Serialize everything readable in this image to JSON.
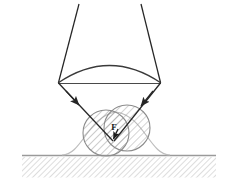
{
  "figure": {
    "background_color": "#ffffff",
    "width": 238,
    "height": 188,
    "labels": [
      {
        "id": "force-label",
        "text": "F",
        "x": 116,
        "y": 129,
        "meaning": "force vector label"
      }
    ],
    "colors": {
      "ray_stroke": "#262626",
      "lens_stroke": "#3a3a3a",
      "circle_stroke": "#8c8c8c",
      "bump_stroke": "#b0b0b0",
      "hatch_particle": "#8c8c8c",
      "hatch_ground": "#b8b8b8",
      "ground_line": "#8f8f8f",
      "label_fill": "#1a1a1a"
    },
    "lens": {
      "name": "converging-lens",
      "left_vertex": [
        58,
        83
      ],
      "right_vertex": [
        161,
        83
      ],
      "arc_apex_y": 62,
      "chord_y": 83
    },
    "rays": [
      {
        "name": "incoming-ray-left",
        "from": [
          79,
          4
        ],
        "to": [
          58,
          83
        ],
        "arrow": false
      },
      {
        "name": "incoming-ray-right",
        "from": [
          141,
          4
        ],
        "to": [
          161,
          83
        ],
        "arrow": false
      },
      {
        "name": "focused-ray-left",
        "from": [
          58,
          83
        ],
        "to": [
          112,
          140
        ],
        "arrow": true,
        "arrow_at": [
          74,
          100
        ]
      },
      {
        "name": "focused-ray-right",
        "from": [
          161,
          83
        ],
        "to": [
          112,
          140
        ],
        "arrow": true,
        "arrow_at": [
          145,
          100
        ]
      }
    ],
    "particle_circles": [
      {
        "name": "particle-circle-left",
        "cx": 106,
        "cy": 133,
        "r": 23
      },
      {
        "name": "particle-circle-right",
        "cx": 127,
        "cy": 128,
        "r": 23
      }
    ],
    "surface_bump": {
      "name": "substrate-bump",
      "baseline_y": 155,
      "peak_x": 116,
      "peak_y": 112,
      "left_foot_x": 68,
      "right_foot_x": 164
    },
    "ground": {
      "name": "substrate-ground",
      "line_y": 155,
      "hatch_top": 157,
      "hatch_bottom": 178,
      "left_x": 22,
      "right_x": 216,
      "hatch_angle_deg": 45
    },
    "force_arrow": {
      "name": "force-vector-arrow",
      "from": [
        117,
        130
      ],
      "to": [
        113,
        142
      ]
    }
  }
}
